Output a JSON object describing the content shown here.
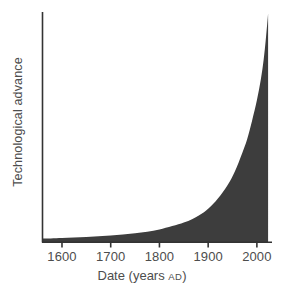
{
  "chart_data": {
    "type": "area",
    "title": "",
    "subtitle": "",
    "xlabel_main": "Date (years",
    "xlabel_era": "AD",
    "xlabel_close": ")",
    "xlabel_full": "Date (years AD)",
    "ylabel": "Technological advance",
    "xlim": [
      1560,
      2030
    ],
    "ylim": [
      0,
      100
    ],
    "xticks": [
      1600,
      1700,
      1800,
      1900,
      2000
    ],
    "xtick_labels": [
      "1600",
      "1700",
      "1800",
      "1900",
      "2000"
    ],
    "yticks": [],
    "ytick_labels": [],
    "grid": false,
    "legend": null,
    "annotations": [],
    "series": [
      {
        "name": "Technological advance",
        "fill_color": "#3d3d3d",
        "x": [
          1560,
          1600,
          1650,
          1700,
          1750,
          1800,
          1850,
          1880,
          1900,
          1920,
          1940,
          1955,
          1970,
          1980,
          1990,
          2000,
          2008,
          2014,
          2018,
          2021,
          2023
        ],
        "y": [
          1.5,
          1.8,
          2.2,
          2.8,
          3.8,
          5.5,
          8.5,
          11.5,
          14.5,
          19,
          25,
          31,
          39,
          45,
          53,
          62,
          71,
          80,
          88,
          95,
          100
        ]
      }
    ]
  },
  "axes": {
    "axis_color": "#333333",
    "tick_color": "#333333",
    "background": "#ffffff",
    "text_color": "#4d4d4d"
  }
}
